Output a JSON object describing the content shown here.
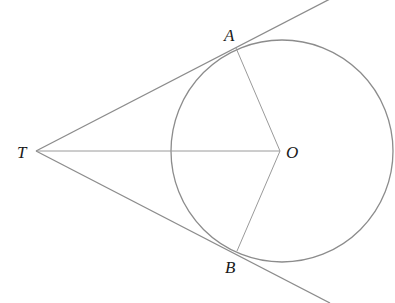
{
  "diagram": {
    "type": "geometry",
    "colors": {
      "stroke": "#8c8c8c",
      "label": "#1a1a1a",
      "background": "#ffffff"
    },
    "circle": {
      "center_label": "O",
      "cx": 282,
      "cy": 151,
      "r": 111
    },
    "points": {
      "T": {
        "label": "T",
        "x": 36,
        "y": 151
      },
      "O": {
        "label": "O",
        "x": 280,
        "y": 151
      },
      "A": {
        "label": "A",
        "x": 236,
        "y": 48
      },
      "B": {
        "label": "B",
        "x": 237,
        "y": 251
      }
    },
    "segments": [
      {
        "name": "tangent-TA",
        "from": "T",
        "through": "A"
      },
      {
        "name": "tangent-TB",
        "from": "T",
        "through": "B"
      },
      {
        "name": "segment-TO",
        "from": "T",
        "to": "O"
      },
      {
        "name": "radius-OA",
        "from": "O",
        "to": "A"
      },
      {
        "name": "radius-OB",
        "from": "O",
        "to": "B"
      }
    ],
    "labels": {
      "A": "A",
      "B": "B",
      "T": "T",
      "O": "O"
    }
  }
}
